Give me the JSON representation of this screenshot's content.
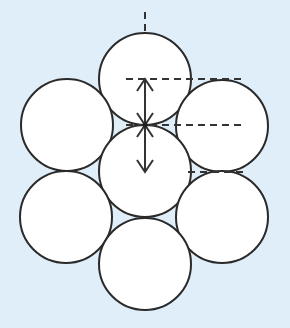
{
  "diagram": {
    "title": "",
    "background_color": "#dfeef8",
    "circle_fill": "#ffffff",
    "stroke_color": "#2a2a2a",
    "radius": 46,
    "circles": [
      {
        "id": "top",
        "cx": 145,
        "cy": 79
      },
      {
        "id": "upper-left",
        "cx": 67,
        "cy": 125
      },
      {
        "id": "upper-right",
        "cx": 222,
        "cy": 126
      },
      {
        "id": "center",
        "cx": 145,
        "cy": 171
      },
      {
        "id": "lower-left",
        "cx": 66,
        "cy": 217
      },
      {
        "id": "lower-right",
        "cx": 222,
        "cy": 217
      },
      {
        "id": "bottom",
        "cx": 145,
        "cy": 264
      }
    ],
    "dashed_lines": [
      {
        "id": "vertical-axis-top",
        "x1": 145,
        "y1": 12,
        "x2": 145,
        "y2": 32
      },
      {
        "id": "level-1",
        "x1": 126,
        "y1": 79,
        "x2": 243,
        "y2": 79
      },
      {
        "id": "level-2",
        "x1": 126,
        "y1": 125,
        "x2": 243,
        "y2": 125
      },
      {
        "id": "level-3",
        "x1": 188,
        "y1": 172,
        "x2": 243,
        "y2": 172
      }
    ],
    "arrows": [
      {
        "id": "upper-double-arrow",
        "x": 145,
        "y1": 79,
        "y2": 125
      },
      {
        "id": "lower-double-arrow",
        "x": 145,
        "y1": 125,
        "y2": 172
      }
    ]
  }
}
